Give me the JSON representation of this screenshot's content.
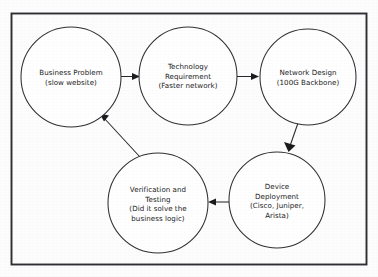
{
  "diagram": {
    "frame": {
      "x": 11,
      "y": 13,
      "width": 356,
      "height": 252
    },
    "colors": {
      "background": "#fdfdfd",
      "frame_stroke": "#2e2e32",
      "node_stroke": "#303034",
      "node_fill": "#ffffff",
      "edge_stroke": "#27272b",
      "text": "#1a1a1a"
    },
    "nodes": [
      {
        "id": "business-problem",
        "cx": 71,
        "cy": 77,
        "r": 50,
        "lines": [
          "Business Problem",
          "(slow website)"
        ]
      },
      {
        "id": "technology-requirement",
        "cx": 188,
        "cy": 76,
        "r": 49,
        "lines": [
          "Technology",
          "Requirement",
          "(Faster network)"
        ]
      },
      {
        "id": "network-design",
        "cx": 308,
        "cy": 77,
        "r": 48,
        "lines": [
          "Network Design",
          "(100G Backbone)"
        ]
      },
      {
        "id": "device-deployment",
        "cx": 277,
        "cy": 200,
        "r": 48,
        "lines": [
          "Device",
          "Deployment",
          "(Cisco, Juniper,",
          "Arista)"
        ]
      },
      {
        "id": "verification-testing",
        "cx": 158,
        "cy": 203,
        "r": 50,
        "lines": [
          "Verification and",
          "Testing",
          "(Did it solve the",
          "business logic)"
        ]
      }
    ],
    "edges": [
      {
        "id": "edge-problem-to-requirement",
        "from": "business-problem",
        "to": "technology-requirement",
        "direction": "right"
      },
      {
        "id": "edge-requirement-to-design",
        "from": "technology-requirement",
        "to": "network-design",
        "direction": "right"
      },
      {
        "id": "edge-design-to-deployment",
        "from": "network-design",
        "to": "device-deployment",
        "direction": "down"
      },
      {
        "id": "edge-deployment-to-verification",
        "from": "device-deployment",
        "to": "verification-testing",
        "direction": "left"
      },
      {
        "id": "edge-verification-to-problem",
        "from": "verification-testing",
        "to": "business-problem",
        "direction": "up-left"
      }
    ]
  }
}
